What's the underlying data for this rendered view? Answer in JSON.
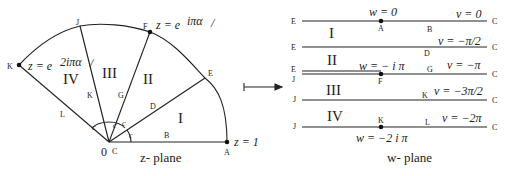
{
  "z_plane": {
    "caption": "z- plane",
    "origin_label": "0",
    "origin_point_label": "C",
    "points": {
      "A": "A",
      "B": "B",
      "D": "D",
      "E": "E",
      "F": "F",
      "G": "G",
      "J": "J",
      "K_ray": "K",
      "K_arc": "K",
      "L": "L"
    },
    "angle_labels": [
      "c",
      "c",
      "c",
      "c"
    ],
    "regions": [
      "I",
      "II",
      "III",
      "IV"
    ],
    "equations": {
      "z1": "z = 1",
      "zF": "z = e",
      "zF_sup": "iπα",
      "zF_tail": "/",
      "zK": "z = e",
      "zK_sup": "2iπα",
      "zK_tail": "/"
    }
  },
  "arrow": {
    "symbol": "maps-to"
  },
  "w_plane": {
    "caption": "w- plane",
    "lines": [
      {
        "left": "E",
        "right": "C",
        "v": "v = 0",
        "mid": "B",
        "point": "A",
        "eq": "w = 0"
      },
      {
        "left": "E",
        "right": "C",
        "v": "v = −π/2",
        "mid": "D"
      },
      {
        "left_top": "E",
        "left_bot": "J",
        "right": "C",
        "v": "v = −π",
        "mid": "G",
        "point": "F",
        "eq": "w = − i π"
      },
      {
        "left": "J",
        "right": "C",
        "v": "v = −3π/2",
        "mid": "K"
      },
      {
        "left": "J",
        "right": "C",
        "v": "v = −2π",
        "mid": "L",
        "point": "K",
        "eq": "w = −2 i π"
      }
    ],
    "regions": [
      "I",
      "II",
      "III",
      "IV"
    ]
  }
}
